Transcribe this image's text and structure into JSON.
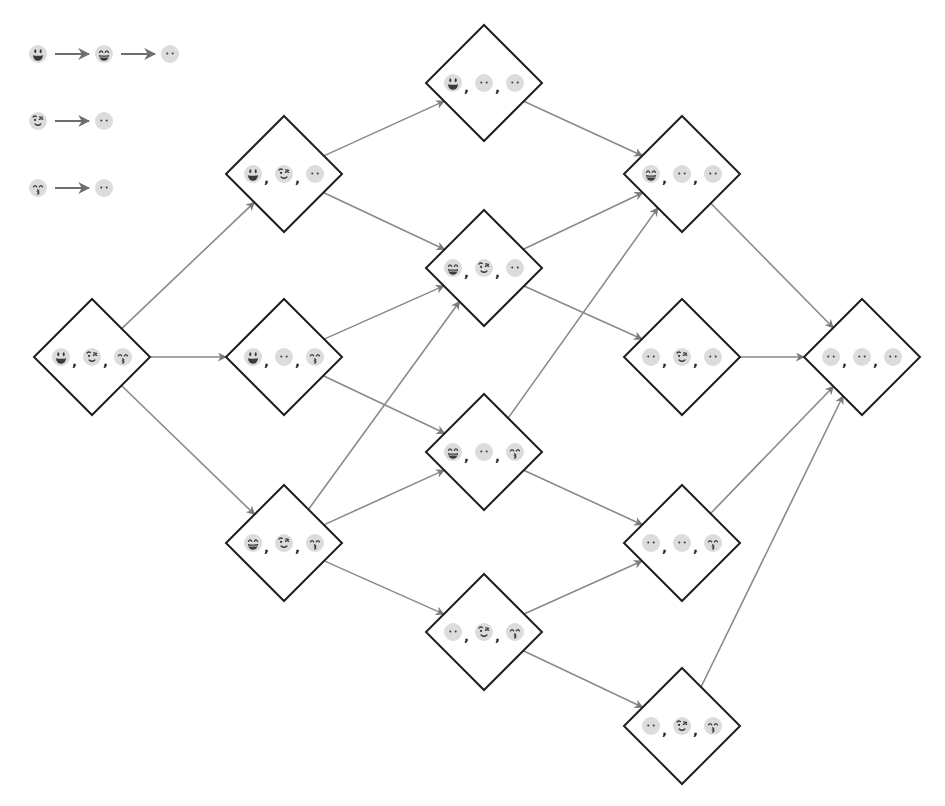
{
  "diagram": {
    "type": "state-transition-lattice",
    "colors": {
      "node_border": "#1f1f1f",
      "edge": "#8a8a8a",
      "face_fill": "#dcdcdc",
      "face_feature": "#3a3a3a"
    },
    "legend": [
      {
        "sequence": [
          "grinning-face",
          "beaming-grin-face",
          "neutral-face"
        ]
      },
      {
        "sequence": [
          "winking-face",
          "neutral-face"
        ]
      },
      {
        "sequence": [
          "kissing-face",
          "neutral-face"
        ]
      }
    ],
    "nodes": [
      {
        "id": "n0",
        "x": 92,
        "y": 357,
        "faces": [
          "grinning-face",
          "winking-face",
          "kissing-face"
        ]
      },
      {
        "id": "n1",
        "x": 284,
        "y": 174,
        "faces": [
          "grinning-face",
          "winking-face",
          "neutral-face"
        ]
      },
      {
        "id": "n2",
        "x": 284,
        "y": 357,
        "faces": [
          "grinning-face",
          "neutral-face",
          "kissing-face"
        ]
      },
      {
        "id": "n3",
        "x": 284,
        "y": 543,
        "faces": [
          "beaming-grin-face",
          "winking-face",
          "kissing-face"
        ]
      },
      {
        "id": "n4",
        "x": 484,
        "y": 83,
        "faces": [
          "grinning-face",
          "neutral-face",
          "neutral-face"
        ]
      },
      {
        "id": "n5",
        "x": 484,
        "y": 268,
        "faces": [
          "beaming-grin-face",
          "winking-face",
          "neutral-face"
        ]
      },
      {
        "id": "n6",
        "x": 484,
        "y": 452,
        "faces": [
          "beaming-grin-face",
          "neutral-face",
          "kissing-face"
        ]
      },
      {
        "id": "n7",
        "x": 484,
        "y": 632,
        "faces": [
          "neutral-face",
          "winking-face",
          "kissing-face"
        ]
      },
      {
        "id": "n8",
        "x": 682,
        "y": 174,
        "faces": [
          "beaming-grin-face",
          "neutral-face",
          "neutral-face"
        ]
      },
      {
        "id": "n9",
        "x": 682,
        "y": 357,
        "faces": [
          "neutral-face",
          "winking-face",
          "neutral-face"
        ]
      },
      {
        "id": "n10",
        "x": 682,
        "y": 543,
        "faces": [
          "neutral-face",
          "neutral-face",
          "kissing-face"
        ]
      },
      {
        "id": "n11",
        "x": 682,
        "y": 726,
        "faces": [
          "neutral-face",
          "winking-face",
          "kissing-face"
        ]
      },
      {
        "id": "n12",
        "x": 862,
        "y": 357,
        "faces": [
          "neutral-face",
          "neutral-face",
          "neutral-face"
        ]
      }
    ],
    "edges": [
      [
        "n0",
        "n1"
      ],
      [
        "n0",
        "n2"
      ],
      [
        "n0",
        "n3"
      ],
      [
        "n1",
        "n4"
      ],
      [
        "n1",
        "n5"
      ],
      [
        "n2",
        "n5"
      ],
      [
        "n2",
        "n6"
      ],
      [
        "n3",
        "n5"
      ],
      [
        "n3",
        "n6"
      ],
      [
        "n3",
        "n7"
      ],
      [
        "n4",
        "n8"
      ],
      [
        "n5",
        "n8"
      ],
      [
        "n5",
        "n9"
      ],
      [
        "n6",
        "n8"
      ],
      [
        "n6",
        "n10"
      ],
      [
        "n7",
        "n10"
      ],
      [
        "n7",
        "n11"
      ],
      [
        "n8",
        "n12"
      ],
      [
        "n9",
        "n12"
      ],
      [
        "n10",
        "n12"
      ],
      [
        "n11",
        "n12"
      ]
    ],
    "separator": ","
  }
}
